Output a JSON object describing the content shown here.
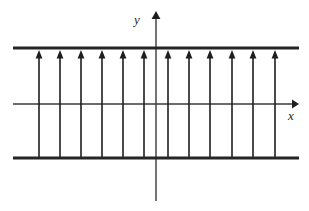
{
  "figure": {
    "width": 309,
    "height": 211,
    "background_color": "#ffffff"
  },
  "axes": {
    "x_axis": {
      "label": "x",
      "label_x": 288,
      "label_y": 120,
      "y": 104,
      "x_start": 13,
      "x_end": 297,
      "stroke": "#3a3a3a",
      "stroke_width": 1.4,
      "arrow": "right"
    },
    "y_axis": {
      "label": "y",
      "label_x": 134,
      "label_y": 24,
      "x": 156,
      "y_start": 13,
      "y_end": 201,
      "stroke": "#3a3a3a",
      "stroke_width": 1.4,
      "arrow": "up"
    }
  },
  "boundaries": {
    "stroke": "#252525",
    "stroke_width": 3,
    "x_start": 13,
    "x_end": 299,
    "top_y": 48,
    "bottom_y": 158
  },
  "chart_data": {
    "type": "line",
    "xlabel": "x",
    "ylabel": "y",
    "grid": false,
    "legend": null,
    "arrow_count": 12,
    "arrow_direction": "up",
    "arrow_stroke": "#1e1e1e",
    "arrow_stroke_width": 1.6,
    "arrow_tail_y": 158,
    "arrow_head_y": 50,
    "arrow_x_positions": [
      39,
      60,
      81,
      102,
      123,
      144,
      168,
      189,
      210,
      232,
      253,
      275
    ],
    "horizontal_lines_y": [
      48,
      158
    ],
    "annotations": []
  }
}
